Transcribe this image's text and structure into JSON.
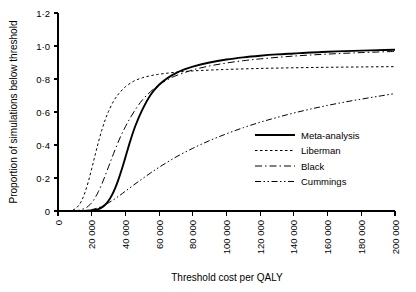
{
  "chart_data": {
    "type": "line",
    "title": "",
    "xlabel": "Threshold cost per QALY",
    "ylabel": "Proportion of simulations below threshold",
    "xlim": [
      0,
      200000
    ],
    "ylim": [
      0,
      1.2
    ],
    "grid": false,
    "legend_position": "center-right",
    "x_ticks": [
      0,
      20000,
      40000,
      60000,
      80000,
      100000,
      120000,
      140000,
      160000,
      180000,
      200000
    ],
    "x_tick_labels": [
      "0",
      "20 000",
      "40 000",
      "60 000",
      "80 000",
      "100 000",
      "120 000",
      "140 000",
      "160 000",
      "180 000",
      "200 000"
    ],
    "x_tick_rotation": -90,
    "y_ticks": [
      0,
      0.2,
      0.4,
      0.6,
      0.8,
      1.0,
      1.2
    ],
    "y_tick_labels": [
      "0",
      "0·2",
      "0·4",
      "0·6",
      "0·8",
      "1·0",
      "1·2"
    ],
    "series": [
      {
        "name": "Meta-analysis",
        "style": "solid",
        "color": "#000000",
        "width": 1.9,
        "dash": "",
        "x": [
          0,
          5000,
          10000,
          15000,
          20000,
          22000,
          24000,
          26000,
          28000,
          30000,
          32000,
          34000,
          36000,
          38000,
          40000,
          43000,
          46000,
          50000,
          55000,
          60000,
          65000,
          70000,
          75000,
          80000,
          90000,
          100000,
          110000,
          120000,
          130000,
          140000,
          150000,
          160000,
          170000,
          180000,
          190000,
          200000
        ],
        "y": [
          0,
          0,
          0,
          0,
          0.003,
          0.006,
          0.012,
          0.022,
          0.038,
          0.062,
          0.096,
          0.14,
          0.195,
          0.258,
          0.325,
          0.428,
          0.518,
          0.613,
          0.705,
          0.765,
          0.806,
          0.836,
          0.858,
          0.875,
          0.9,
          0.918,
          0.931,
          0.941,
          0.949,
          0.955,
          0.961,
          0.965,
          0.969,
          0.972,
          0.975,
          0.977
        ]
      },
      {
        "name": "Liberman",
        "style": "dotted",
        "color": "#000000",
        "width": 1.0,
        "dash": "2.5,2.5",
        "x": [
          0,
          4000,
          8000,
          10000,
          12000,
          14000,
          16000,
          18000,
          20000,
          22000,
          24000,
          26000,
          28000,
          30000,
          33000,
          36000,
          40000,
          45000,
          50000,
          55000,
          60000,
          70000,
          80000,
          90000,
          100000,
          120000,
          140000,
          160000,
          180000,
          200000
        ],
        "y": [
          0,
          0,
          0.004,
          0.012,
          0.03,
          0.062,
          0.112,
          0.178,
          0.256,
          0.338,
          0.418,
          0.49,
          0.552,
          0.604,
          0.666,
          0.71,
          0.753,
          0.787,
          0.807,
          0.82,
          0.829,
          0.841,
          0.849,
          0.854,
          0.858,
          0.864,
          0.868,
          0.871,
          0.873,
          0.875
        ]
      },
      {
        "name": "Black",
        "style": "dashdot",
        "color": "#000000",
        "width": 1.0,
        "dash": "7,3,1.5,3",
        "x": [
          0,
          8000,
          12000,
          16000,
          18000,
          20000,
          22000,
          24000,
          26000,
          28000,
          30000,
          32000,
          35000,
          38000,
          41000,
          45000,
          50000,
          55000,
          60000,
          65000,
          70000,
          80000,
          90000,
          100000,
          110000,
          120000,
          140000,
          160000,
          180000,
          200000
        ],
        "y": [
          0,
          0,
          0.004,
          0.016,
          0.03,
          0.05,
          0.08,
          0.118,
          0.163,
          0.214,
          0.268,
          0.322,
          0.4,
          0.47,
          0.53,
          0.6,
          0.672,
          0.724,
          0.765,
          0.796,
          0.82,
          0.855,
          0.879,
          0.897,
          0.911,
          0.922,
          0.939,
          0.951,
          0.96,
          0.967
        ]
      },
      {
        "name": "Cummings",
        "style": "dashdotdot",
        "color": "#000000",
        "width": 1.0,
        "dash": "6,2.5,1.5,2.5,1.5,2.5",
        "x": [
          0,
          12000,
          16000,
          20000,
          24000,
          28000,
          32000,
          36000,
          40000,
          45000,
          50000,
          55000,
          60000,
          70000,
          80000,
          90000,
          100000,
          110000,
          120000,
          130000,
          140000,
          150000,
          160000,
          170000,
          180000,
          190000,
          200000
        ],
        "y": [
          0,
          0,
          0.002,
          0.008,
          0.02,
          0.038,
          0.062,
          0.09,
          0.12,
          0.158,
          0.195,
          0.231,
          0.265,
          0.327,
          0.38,
          0.427,
          0.468,
          0.505,
          0.538,
          0.567,
          0.594,
          0.618,
          0.64,
          0.66,
          0.678,
          0.695,
          0.712
        ]
      }
    ]
  },
  "legend": {
    "items": [
      {
        "label": "Meta-analysis"
      },
      {
        "label": "Liberman"
      },
      {
        "label": "Black"
      },
      {
        "label": "Cummings"
      }
    ]
  }
}
